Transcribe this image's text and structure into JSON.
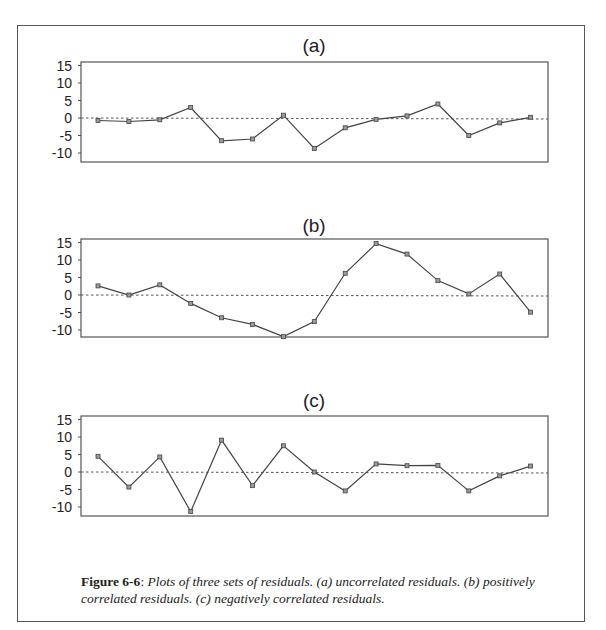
{
  "figure": {
    "label": "Figure 6-6",
    "separator": ": ",
    "caption_text": "Plots of three sets of residuals. (a) uncorrelated residuals. (b) positively correlated residuals. (c) negatively correlated residuals."
  },
  "colors": {
    "line": "#444444",
    "frame": "#555555",
    "text": "#222222"
  },
  "chart_data": [
    {
      "type": "line",
      "title": "(a)",
      "xlabel": "",
      "ylabel": "",
      "x": [
        1,
        2,
        3,
        4,
        5,
        6,
        7,
        8,
        9,
        10,
        11,
        12,
        13,
        14,
        15
      ],
      "values": [
        -0.7,
        -1.0,
        -0.5,
        3.0,
        -6.5,
        -6.0,
        0.8,
        -8.7,
        -2.8,
        -0.4,
        0.6,
        4.0,
        -5.0,
        -1.4,
        0.2
      ],
      "yticks": [
        15,
        10,
        5,
        0,
        -5,
        -10
      ],
      "ylim": [
        -12.5,
        16
      ],
      "reference_line": {
        "y": 0,
        "style": "dotted"
      },
      "grid": false,
      "markers": true,
      "description": "uncorrelated residuals"
    },
    {
      "type": "line",
      "title": "(b)",
      "xlabel": "",
      "ylabel": "",
      "x": [
        1,
        2,
        3,
        4,
        5,
        6,
        7,
        8,
        9,
        10,
        11,
        12,
        13,
        14,
        15
      ],
      "values": [
        2.6,
        0.0,
        2.9,
        -2.4,
        -6.5,
        -8.4,
        -11.9,
        -7.6,
        6.2,
        14.7,
        11.7,
        4.1,
        0.3,
        6.0,
        -4.9
      ],
      "yticks": [
        15,
        10,
        5,
        0,
        -5,
        -10
      ],
      "ylim": [
        -12.5,
        16
      ],
      "reference_line": {
        "y": 0,
        "style": "dotted"
      },
      "grid": false,
      "markers": true,
      "description": "positively correlated residuals"
    },
    {
      "type": "line",
      "title": "(c)",
      "xlabel": "",
      "ylabel": "",
      "x": [
        1,
        2,
        3,
        4,
        5,
        6,
        7,
        8,
        9,
        10,
        11,
        12,
        13,
        14,
        15
      ],
      "values": [
        4.5,
        -4.3,
        4.3,
        -11.3,
        9.1,
        -3.9,
        7.5,
        0.0,
        -5.4,
        2.3,
        1.8,
        1.9,
        -5.4,
        -1.1,
        1.7
      ],
      "yticks": [
        15,
        10,
        5,
        0,
        -5,
        -10
      ],
      "ylim": [
        -12.5,
        16
      ],
      "reference_line": {
        "y": 0,
        "style": "dotted"
      },
      "grid": false,
      "markers": true,
      "description": "negatively correlated residuals"
    }
  ],
  "layout": {
    "panels": [
      {
        "box": {
          "left": 81,
          "top": 62,
          "right": 548,
          "bottom": 162
        },
        "zero_y": 118,
        "title_y": 52
      },
      {
        "box": {
          "left": 81,
          "top": 239,
          "right": 548,
          "bottom": 337
        },
        "zero_y": 295,
        "title_y": 232
      },
      {
        "box": {
          "left": 81,
          "top": 416,
          "right": 548,
          "bottom": 516
        },
        "zero_y": 472,
        "title_y": 407
      }
    ],
    "px_per_unit": 3.5,
    "first_x": 98,
    "x_step": 30.9,
    "title_x": 314
  }
}
